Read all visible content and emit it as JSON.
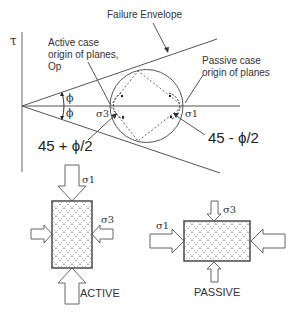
{
  "diagram": {
    "axis": {
      "tau_label": "τ"
    },
    "labels": {
      "failure_envelope": "Failure Envelope",
      "active_origin_line1": "Active case",
      "active_origin_line2": "origin of planes,",
      "active_origin_line3": "Op",
      "passive_origin_line1": "Passive case",
      "passive_origin_line2": "origin of planes",
      "phi_upper": "ϕ",
      "phi_lower": "ϕ",
      "sigma3": "σ3",
      "sigma1": "σ1",
      "active_angle": "45 + ϕ/2",
      "passive_angle": "45 - ϕ/2"
    },
    "active_block": {
      "top_stress": "σ1",
      "side_stress": "σ3",
      "caption": "ACTIVE"
    },
    "passive_block": {
      "side_stress": "σ1",
      "top_stress": "σ3",
      "caption": "PASSIVE"
    },
    "colors": {
      "line": "#555555",
      "text": "#222222",
      "hatch": "#777777",
      "background": "#ffffff"
    }
  }
}
